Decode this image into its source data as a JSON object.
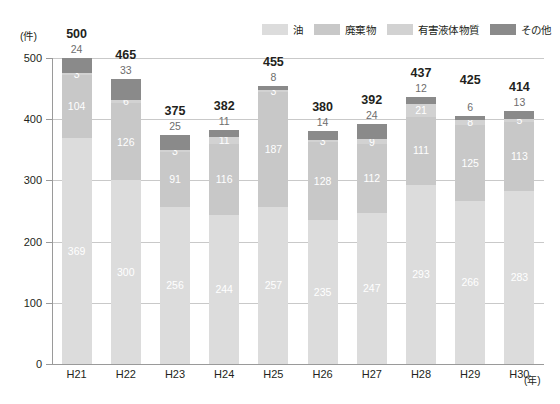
{
  "chart_data": {
    "type": "bar",
    "stacked": true,
    "title": "",
    "xlabel": "(年)",
    "ylabel": "(件)",
    "ylim": [
      0,
      500
    ],
    "yticks": [
      0,
      100,
      200,
      300,
      400,
      500
    ],
    "grid": true,
    "legend_position": "top-right",
    "categories": [
      "H21",
      "H22",
      "H23",
      "H24",
      "H25",
      "H26",
      "H27",
      "H28",
      "H29",
      "H30"
    ],
    "series": [
      {
        "name": "油",
        "color": "#dcdcdc",
        "values": [
          369,
          300,
          256,
          244,
          257,
          235,
          247,
          293,
          266,
          283
        ]
      },
      {
        "name": "廃棄物",
        "color": "#c8c8c8",
        "values": [
          104,
          126,
          91,
          116,
          187,
          128,
          112,
          111,
          125,
          113
        ]
      },
      {
        "name": "有害液体物質",
        "color": "#d2d2d2",
        "values": [
          3,
          6,
          3,
          11,
          3,
          3,
          9,
          21,
          8,
          5
        ]
      },
      {
        "name": "その他",
        "color": "#8a8a8a",
        "values": [
          24,
          33,
          25,
          11,
          8,
          14,
          24,
          12,
          6,
          13
        ]
      }
    ],
    "totals": [
      500,
      465,
      375,
      382,
      455,
      380,
      392,
      437,
      425,
      414
    ]
  },
  "legend": {
    "items": [
      {
        "label": "油",
        "color": "#dcdcdc"
      },
      {
        "label": "廃棄物",
        "color": "#c8c8c8"
      },
      {
        "label": "有害液体物質",
        "color": "#d2d2d2"
      },
      {
        "label": "その他",
        "color": "#8a8a8a"
      }
    ]
  },
  "axes": {
    "y_unit": "(件)",
    "x_unit": "(年)",
    "y_tick_labels": [
      "0",
      "100",
      "200",
      "300",
      "400",
      "500"
    ],
    "x_tick_labels": [
      "H21",
      "H22",
      "H23",
      "H24",
      "H25",
      "H26",
      "H27",
      "H28",
      "H29",
      "H30"
    ]
  },
  "colors": {
    "gridline": "#c9c9c9",
    "axis": "#9a9a9a",
    "text": "#231f20",
    "muted_text": "#6d6d6d"
  }
}
